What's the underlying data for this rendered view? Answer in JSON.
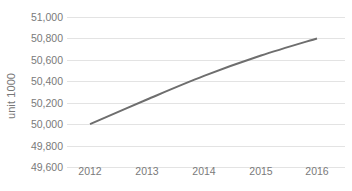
{
  "chart_data": {
    "type": "line",
    "title": "",
    "xlabel": "",
    "ylabel": "unit 1000",
    "categories": [
      "2012",
      "2013",
      "2014",
      "2015",
      "2016"
    ],
    "series": [
      {
        "name": "",
        "values": [
          50000,
          50230,
          50450,
          50640,
          50800
        ],
        "color": "#6e6e6e",
        "line_width": 2,
        "smooth": true,
        "markers": false
      }
    ],
    "ylim": [
      49600,
      51000
    ],
    "ytick_step": 200,
    "ytick_labels": [
      "51,000",
      "50,800",
      "50,600",
      "50,400",
      "50,200",
      "50,000",
      "49,800",
      "49,600"
    ],
    "ytick_values": [
      51000,
      50800,
      50600,
      50400,
      50200,
      50000,
      49800,
      49600
    ],
    "grid": true,
    "grid_axis": "y",
    "grid_color": "#e3e3e3",
    "legend": false,
    "legend_position": "none",
    "background": "#ffffff",
    "axis_text_color": "#7a7a7a"
  }
}
